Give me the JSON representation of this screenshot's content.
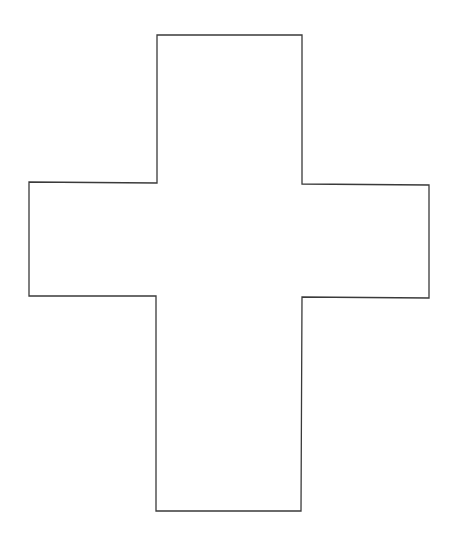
{
  "diagram": {
    "shape": "cross",
    "stroke_color": "#3a3a3a",
    "fill_color": "#ffffff",
    "background": "#ffffff",
    "stroke_width": 1.3,
    "points": [
      [
        157,
        35
      ],
      [
        302,
        35
      ],
      [
        302,
        184
      ],
      [
        429,
        185
      ],
      [
        429,
        298
      ],
      [
        302,
        297
      ],
      [
        301,
        511
      ],
      [
        156,
        511
      ],
      [
        156,
        296
      ],
      [
        29,
        296
      ],
      [
        29,
        182
      ],
      [
        157,
        183
      ]
    ]
  }
}
